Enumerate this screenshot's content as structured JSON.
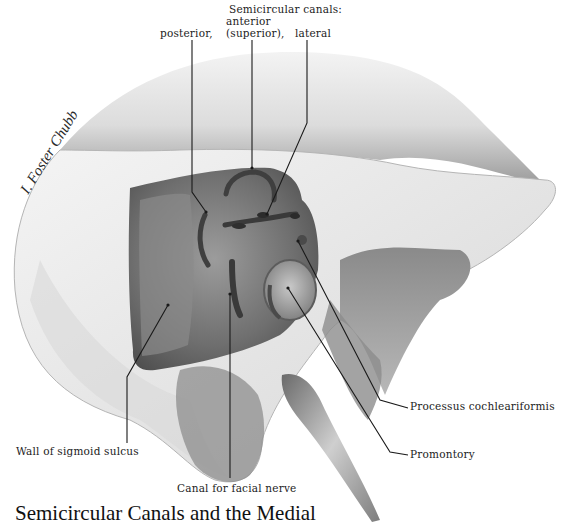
{
  "figure": {
    "type": "anatomical-illustration",
    "artist_signature": "I. Foster Chubb",
    "header_label": "Semicircular canals:",
    "labels": {
      "posterior": "posterior,",
      "anterior_line1": "anterior",
      "anterior_line2": "(superior),",
      "lateral": "lateral",
      "processus": "Processus cochleariformis",
      "promontory": "Promontory",
      "sigmoid": "Wall of sigmoid sulcus",
      "facial": "Canal for facial nerve"
    },
    "caption": "Semicircular Canals and the Medial",
    "colors": {
      "background": "#ffffff",
      "bone_light": "#e6e6e6",
      "bone_mid": "#a8a8a8",
      "bone_dark": "#5a5a5a",
      "leader_line": "#1a1a1a"
    }
  }
}
